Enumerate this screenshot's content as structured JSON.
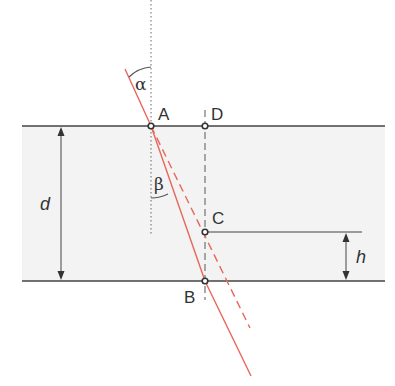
{
  "diagram": {
    "colors": {
      "background": "#ffffff",
      "slab_fill": "#f2f2f2",
      "boundary": "#444444",
      "ray": "#e8675a",
      "construction": "#555555"
    },
    "points": {
      "A": {
        "label": "A",
        "x": 151,
        "y": 126
      },
      "D": {
        "label": "D",
        "x": 205,
        "y": 126
      },
      "C": {
        "label": "C",
        "x": 205,
        "y": 232
      },
      "B": {
        "label": "B",
        "x": 205,
        "y": 281
      }
    },
    "angles": {
      "incidence": {
        "label": "α"
      },
      "refraction": {
        "label": "β"
      }
    },
    "dimensions": {
      "slab_thickness": {
        "label": "d"
      },
      "displacement": {
        "label": "h"
      }
    },
    "slab": {
      "top_y": 126,
      "bottom_y": 281,
      "left_x": 22,
      "right_x": 385
    }
  }
}
